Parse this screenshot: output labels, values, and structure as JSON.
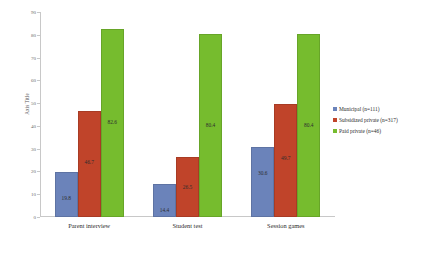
{
  "chart_data": {
    "type": "bar",
    "title": "",
    "xlabel": "",
    "ylabel": "Axis Title",
    "ylim": [
      0,
      90
    ],
    "ytick_step": 10,
    "yticks": [
      "0",
      "10",
      "20",
      "30",
      "40",
      "50",
      "60",
      "70",
      "80",
      "90"
    ],
    "grid": false,
    "legend_position": "right",
    "categories": [
      "Parent interview",
      "Student test",
      "Session games"
    ],
    "series": [
      {
        "name": "Municipal (n=111)",
        "color": "#6b83ba",
        "values": [
          19.8,
          14.4,
          30.6
        ],
        "labels": [
          "19.8",
          "14.4",
          "30.6"
        ]
      },
      {
        "name": "Subsidized private (n=317)",
        "color": "#c0442a",
        "values": [
          46.7,
          26.5,
          49.7
        ],
        "labels": [
          "46.7",
          "26.5",
          "49.7"
        ]
      },
      {
        "name": "Paid private (n=46)",
        "color": "#76bc2e",
        "values": [
          82.6,
          80.4,
          80.4
        ],
        "labels": [
          "82.6",
          "80.4",
          "80.4"
        ]
      }
    ]
  }
}
